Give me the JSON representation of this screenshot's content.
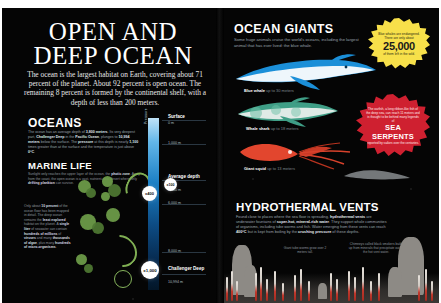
{
  "spread": {
    "background": "#050505",
    "accent_red": "#cf2030",
    "accent_yellow": "#f7e04a",
    "accent_blue": "#1b8fd8"
  },
  "left_page": {
    "title": "OPEN AND DEEP OCEAN",
    "intro": "The ocean is the largest habitat on Earth, covering about 71 percent of the planet. About 92 percent is open ocean. The remaining 8 percent is formed by the continental shelf, with a depth of less than 200 meters.",
    "oceans": {
      "heading": "OCEANS",
      "body_html": "The ocean has an average depth of <b>3,800 meters</b>. Its very deepest part, <b>Challenger Deep</b> in the <b>Pacific Ocean</b>, plunges to <b>10,994 meters</b> below the surface. The <b>pressure</b> at this depth is nearly <b>1,100</b> times greater than at the surface and the temperature is just above <b>0°C</b>."
    },
    "marine_life": {
      "heading": "MARINE LIFE",
      "body_html": "Sunlight only reaches the upper layer of the ocean, the <b>photic zone</b>. Away from the coast, the open ocean is a vast, nutrient-poor desert where only <b>drifting plankton</b> can survive.",
      "body2_html": "Only about <b>10 percent</b> of the ocean floor has been mapped in detail. The deep ocean remains the <b>least explored</b> habitat on the planet. A <b>single liter</b> of seawater can contain <b>hundreds of millions</b> of <b>viruses</b> and many <b>thousands of algae</b>, plus many <b>hundreds of micro-organisms</b>."
    },
    "depth_scale": {
      "axis_label": "Pressure",
      "ticks": [
        {
          "label": "Surface",
          "sub": "0 m",
          "bold": true
        },
        {
          "label": "",
          "sub": "1,000 m",
          "bold": false
        },
        {
          "label": "Average depth",
          "sub": "3,800 m",
          "bold": true
        },
        {
          "label": "",
          "sub": "6,000 m",
          "bold": false
        },
        {
          "label": "",
          "sub": "8,000 m",
          "bold": false
        },
        {
          "label": "Challenger Deep",
          "sub": "10,994 m",
          "bold": true
        }
      ],
      "markers": [
        {
          "name": "pressure-marker-400",
          "text": "x400"
        },
        {
          "name": "pressure-marker-1000",
          "text": "x1,000"
        },
        {
          "name": "pressure-marker-100",
          "text": "x100"
        }
      ]
    }
  },
  "right_page": {
    "ocean_giants": {
      "heading": "OCEAN GIANTS",
      "body": "Some huge animals cruise the world’s oceans, including the largest animal that has ever lived: the blue whale.",
      "badge": {
        "caption_top": "Blue whales are endangered. There are only about",
        "number": "25,000",
        "caption_bottom": "of them left in the wild."
      },
      "species": [
        {
          "name": "Blue whale",
          "size": "up to 30 meters"
        },
        {
          "name": "Whale shark",
          "size": "up to 18 meters"
        },
        {
          "name": "Giant squid",
          "size": "up to 13 meters"
        }
      ]
    },
    "sea_serpents": {
      "caption_top": "The oarfish, a long ribbon-like fish of the deep sea, can reach 11 meters and is thought to be behind many legends of",
      "title": "SEA SERPENTS",
      "caption_bottom": "reported by sailors over the centuries."
    },
    "hydrothermal_vents": {
      "heading": "HYDROTHERMAL VENTS",
      "body_html": "Found close to places where the sea floor is spreading, <b>hydrothermal vents</b> are underwater fountains of <b>super-hot, mineral-rich water</b>. They support whole communities of organisms, including tube worms and fish. Water emerging from these vents can reach <b>400°C</b> but is kept from boiling by the <b>crushing pressure</b> of these depths.",
      "note_left": "Giant tube worms grow over 2 meters tall.",
      "note_right": "Chimneys called black smokers build up from minerals that precipitate out of the hot vent water."
    }
  }
}
